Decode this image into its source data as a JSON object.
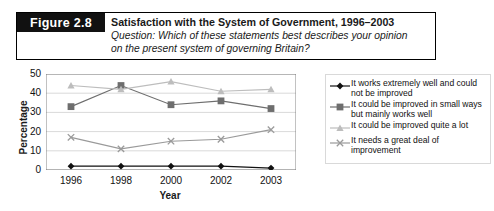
{
  "figure": {
    "number_label": "Figure 2.8",
    "title": "Satisfaction with the System of Government, 1996–2003",
    "subtitle_line1": "Question: Which of these statements best describes your opinion",
    "subtitle_line2": "on the present system of governing Britain?"
  },
  "chart_data": {
    "type": "line",
    "title": "Satisfaction with the System of Government, 1996–2003",
    "xlabel": "Year",
    "ylabel": "Percentage",
    "categories": [
      "1996",
      "1998",
      "2000",
      "2002",
      "2003"
    ],
    "ylim": [
      0,
      50
    ],
    "yticks": [
      0,
      10,
      20,
      30,
      40,
      50
    ],
    "grid": true,
    "legend_position": "right",
    "series": [
      {
        "name": "It works extremely well and could not be improved",
        "marker": "diamond",
        "color": "#111111",
        "values": [
          2,
          2,
          2,
          2,
          1
        ]
      },
      {
        "name": "It could be improved in small ways but mainly works well",
        "marker": "square",
        "color": "#6e6e6e",
        "values": [
          33,
          44,
          34,
          36,
          32
        ]
      },
      {
        "name": "It could be improved quite a lot",
        "marker": "triangle",
        "color": "#bdbdbd",
        "values": [
          44,
          42,
          46,
          41,
          42
        ]
      },
      {
        "name": "It needs a great deal of improvement",
        "marker": "cross",
        "color": "#9a9a9a",
        "values": [
          17,
          11,
          15,
          16,
          21
        ]
      }
    ]
  },
  "legend": {
    "entries": [
      "It works extremely well and could not be improved",
      "It could be improved in small ways but mainly works well",
      "It could be improved quite a lot",
      "It needs a great deal of improvement"
    ]
  }
}
